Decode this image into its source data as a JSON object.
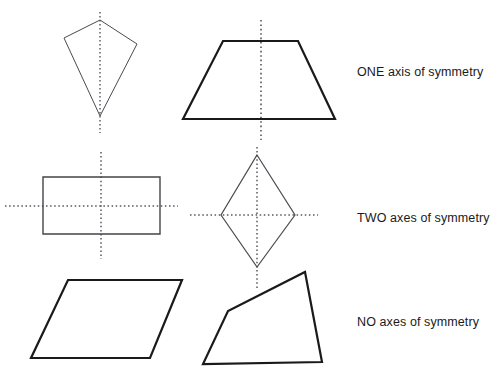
{
  "figure": {
    "background_color": "#ffffff",
    "stroke_color": "#1a1a1a",
    "thin_stroke_color": "#44444a",
    "dotted_color": "#55555c",
    "rows": [
      {
        "label": "ONE axis of symmetry",
        "shapes": [
          "kite",
          "trapezoid"
        ],
        "axis_count": 1
      },
      {
        "label": "TWO axes of symmetry",
        "shapes": [
          "rectangle",
          "rhombus"
        ],
        "axis_count": 2
      },
      {
        "label": "NO axes of symmetry",
        "shapes": [
          "parallelogram",
          "irregular-quadrilateral"
        ],
        "axis_count": 0
      }
    ],
    "shapes": {
      "kite": {
        "name": "kite",
        "points": "100,20 137,44 100,116 64,38",
        "stroke_width": 1,
        "stroke": "#4a4a50"
      },
      "trapezoid": {
        "name": "trapezoid",
        "points": "223,41 298,41 335,119 183,119",
        "stroke_width": 2.2,
        "stroke": "#1a1a1a"
      },
      "rectangle": {
        "name": "rectangle",
        "points": "43,177 160,177 160,234 43,234",
        "stroke_width": 1.4,
        "stroke": "#44444a"
      },
      "rhombus": {
        "name": "rhombus",
        "points": "257,155 295,215 257,267 221,215",
        "stroke_width": 1.2,
        "stroke": "#4a4a50"
      },
      "parallelogram": {
        "name": "parallelogram",
        "points": "68,280 182,280 150,358 31,358",
        "stroke_width": 2.2,
        "stroke": "#1a1a1a"
      },
      "irregular-quadrilateral": {
        "name": "irregular quadrilateral",
        "points": "305,272 322,362 203,364 228,311",
        "stroke_width": 2.2,
        "stroke": "#1a1a1a"
      }
    },
    "symmetry_axes": {
      "kite_vertical": {
        "x1": 100,
        "y1": 12,
        "x2": 100,
        "y2": 133,
        "orientation": "vertical"
      },
      "trapezoid_vertical": {
        "x1": 261,
        "y1": 20,
        "x2": 261,
        "y2": 140,
        "orientation": "vertical"
      },
      "rectangle_vertical": {
        "x1": 101,
        "y1": 152,
        "x2": 101,
        "y2": 259,
        "orientation": "vertical"
      },
      "rectangle_horizontal": {
        "x1": 5,
        "y1": 206,
        "x2": 178,
        "y2": 206,
        "orientation": "horizontal"
      },
      "rhombus_vertical": {
        "x1": 257,
        "y1": 147,
        "x2": 257,
        "y2": 288,
        "orientation": "vertical"
      },
      "rhombus_horizontal": {
        "x1": 190,
        "y1": 215,
        "x2": 318,
        "y2": 215,
        "orientation": "horizontal"
      }
    }
  },
  "labels": {
    "one": "ONE axis of symmetry",
    "two": "TWO axes of symmetry",
    "no": "NO axes of symmetry"
  }
}
